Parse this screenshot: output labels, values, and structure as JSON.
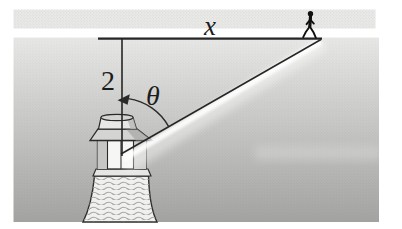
{
  "figure": {
    "labels": {
      "x": "x",
      "two": "2",
      "theta": "θ"
    },
    "colors": {
      "band": "#e9e9e7",
      "panel_top": "#e8e8e6",
      "panel_bottom": "#a3a3a1",
      "ink": "#262626",
      "beam_glow": "#ffffff",
      "lighthouse_fill": "#f0f0ee",
      "lighthouse_texture": "#a2a2a0",
      "roof_fill": "#d4d4d2",
      "roof_shadow": "#a8a8a6",
      "lantern_panel_shade": "#c6c6c4",
      "person": "#111111"
    }
  }
}
